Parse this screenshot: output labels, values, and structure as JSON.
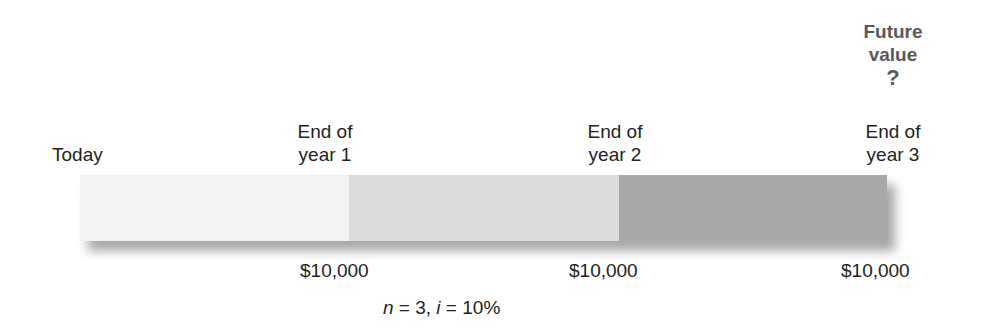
{
  "timeline": {
    "points": [
      {
        "label_line1": "Today",
        "label_line2": ""
      },
      {
        "label_line1": "End of",
        "label_line2": "year 1",
        "amount": "$10,000"
      },
      {
        "label_line1": "End of",
        "label_line2": "year 2",
        "amount": "$10,000"
      },
      {
        "label_line1": "End of",
        "label_line2": "year 3",
        "amount": "$10,000"
      }
    ],
    "future_value": {
      "line1": "Future",
      "line2": "value",
      "symbol": "?"
    },
    "segment_colors": [
      "#f2f2f2",
      "#dcdcdc",
      "#a9a9a9"
    ]
  },
  "params": {
    "n_var": "n",
    "n_eq": " = 3, ",
    "i_var": "i",
    "i_eq": " = 10%"
  }
}
